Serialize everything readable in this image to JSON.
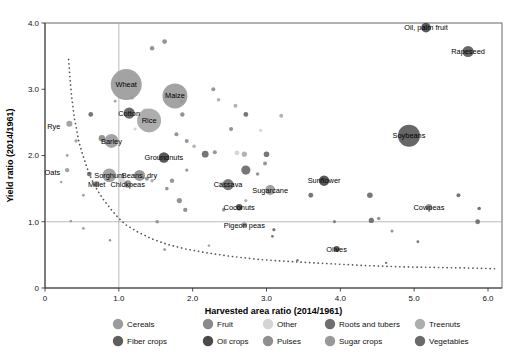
{
  "chart_data": {
    "type": "scatter",
    "title": "",
    "xlabel": "Harvested area ratio (2014/1961)",
    "ylabel": "Yield ratio (2014/1961)",
    "xlim": [
      0,
      6.2
    ],
    "ylim": [
      0,
      4.15
    ],
    "xticks": [
      "0",
      "1.0",
      "2.0",
      "3.0",
      "4.0",
      "5.0",
      "6.0"
    ],
    "xtick_values": [
      0,
      1,
      2,
      3,
      4,
      5,
      6
    ],
    "yticks": [
      "0",
      "1.0",
      "2.0",
      "3.0",
      "4.0"
    ],
    "ytick_values": [
      0,
      1,
      2,
      3,
      4
    ],
    "grid": false,
    "reference_lines": {
      "vertical_x": 1.0,
      "horizontal_y": 1.0
    },
    "annotation_curve": {
      "description": "dotted iso-production hyperbola curve x*y = 1",
      "points": [
        [
          0.32,
          3.45
        ],
        [
          0.34,
          3.15
        ],
        [
          0.36,
          2.9
        ],
        [
          0.38,
          2.72
        ],
        [
          0.4,
          2.55
        ],
        [
          0.43,
          2.38
        ],
        [
          0.46,
          2.2
        ],
        [
          0.5,
          2.05
        ],
        [
          0.55,
          1.88
        ],
        [
          0.6,
          1.72
        ],
        [
          0.66,
          1.57
        ],
        [
          0.73,
          1.44
        ],
        [
          0.8,
          1.32
        ],
        [
          0.9,
          1.18
        ],
        [
          1.0,
          1.05
        ],
        [
          1.1,
          0.95
        ],
        [
          1.25,
          0.85
        ],
        [
          1.45,
          0.74
        ],
        [
          1.65,
          0.66
        ],
        [
          1.9,
          0.59
        ],
        [
          2.2,
          0.53
        ],
        [
          2.5,
          0.48
        ],
        [
          2.9,
          0.43
        ],
        [
          3.3,
          0.4
        ],
        [
          3.8,
          0.37
        ],
        [
          4.3,
          0.34
        ],
        [
          4.8,
          0.32
        ],
        [
          5.3,
          0.31
        ],
        [
          5.8,
          0.3
        ],
        [
          6.1,
          0.29
        ]
      ]
    },
    "legend": {
      "position": "bottom",
      "rows": [
        [
          {
            "label": "Cereals",
            "color": "#9b9b9b"
          },
          {
            "label": "Fruit",
            "color": "#8a8a8a"
          },
          {
            "label": "Other",
            "color": "#d4d4d4"
          },
          {
            "label": "Roots and tubers",
            "color": "#6e6e6e"
          },
          {
            "label": "Treenuts",
            "color": "#adadad"
          }
        ],
        [
          {
            "label": "Fiber crops",
            "color": "#5e5e5e"
          },
          {
            "label": "Oil crops",
            "color": "#4a4a4a"
          },
          {
            "label": "Pulses",
            "color": "#8f8f8f"
          },
          {
            "label": "Sugar crops",
            "color": "#989898"
          },
          {
            "label": "Vegetables",
            "color": "#6a6a6a"
          }
        ]
      ]
    },
    "labeled_points": [
      {
        "name": "Wheat",
        "x": 1.1,
        "y": 3.07,
        "r": 15.5,
        "color": "#9b9b9b",
        "group": "Cereals",
        "label_dx": 0,
        "label_dy": 0,
        "label_anchor": "middle"
      },
      {
        "name": "Maize",
        "x": 1.76,
        "y": 2.9,
        "r": 12.5,
        "color": "#9b9b9b",
        "group": "Cereals",
        "label_dx": 0,
        "label_dy": 0,
        "label_anchor": "middle"
      },
      {
        "name": "Rice",
        "x": 1.41,
        "y": 2.53,
        "r": 12.0,
        "color": "#a6a6a6",
        "group": "Cereals",
        "label_dx": 0,
        "label_dy": 0,
        "label_anchor": "middle"
      },
      {
        "name": "Cotton",
        "x": 1.14,
        "y": 2.64,
        "r": 5.6,
        "color": "#5e5e5e",
        "group": "Fiber crops",
        "label_dx": 0,
        "label_dy": 0,
        "label_anchor": "middle"
      },
      {
        "name": "Barley",
        "x": 0.9,
        "y": 2.22,
        "r": 7.0,
        "color": "#9b9b9b",
        "group": "Cereals",
        "label_dx": 0,
        "label_dy": 0,
        "label_anchor": "middle"
      },
      {
        "name": "Rye",
        "x": 0.33,
        "y": 2.48,
        "r": 3.0,
        "color": "#9b9b9b",
        "group": "Cereals",
        "label_dx": -9,
        "label_dy": 2.5,
        "label_anchor": "end"
      },
      {
        "name": "Oats",
        "x": 0.3,
        "y": 1.78,
        "r": 2.2,
        "color": "#9b9b9b",
        "group": "Cereals",
        "label_dx": -7,
        "label_dy": 2.5,
        "label_anchor": "end"
      },
      {
        "name": "Groundnuts",
        "x": 1.61,
        "y": 1.97,
        "r": 5.2,
        "color": "#4a4a4a",
        "group": "Oil crops",
        "label_dx": 0,
        "label_dy": 0,
        "label_anchor": "middle"
      },
      {
        "name": "Sorghum",
        "x": 0.87,
        "y": 1.7,
        "r": 6.8,
        "color": "#9b9b9b",
        "group": "Cereals",
        "label_dx": 0,
        "label_dy": 0,
        "label_anchor": "middle"
      },
      {
        "name": "Beans, dry",
        "x": 1.28,
        "y": 1.7,
        "r": 5.5,
        "color": "#8f8f8f",
        "group": "Pulses",
        "label_dx": 0,
        "label_dy": 0,
        "label_anchor": "middle"
      },
      {
        "name": "Millet",
        "x": 0.7,
        "y": 1.57,
        "r": 3.0,
        "color": "#9b9b9b",
        "group": "Cereals",
        "label_dx": 0,
        "label_dy": 0,
        "label_anchor": "middle"
      },
      {
        "name": "Chickpeas",
        "x": 1.12,
        "y": 1.57,
        "r": 3.8,
        "color": "#8f8f8f",
        "group": "Pulses",
        "label_dx": 0,
        "label_dy": 0,
        "label_anchor": "middle"
      },
      {
        "name": "Cassava",
        "x": 2.48,
        "y": 1.56,
        "r": 5.6,
        "color": "#6e6e6e",
        "group": "Roots and tubers",
        "label_dx": 0,
        "label_dy": 0,
        "label_anchor": "middle"
      },
      {
        "name": "Sugarcane",
        "x": 3.05,
        "y": 1.48,
        "r": 5.0,
        "color": "#989898",
        "group": "Sugar crops",
        "label_dx": 0,
        "label_dy": 0,
        "label_anchor": "middle"
      },
      {
        "name": "Sunflower",
        "x": 3.78,
        "y": 1.62,
        "r": 5.2,
        "color": "#4a4a4a",
        "group": "Oil crops",
        "label_dx": 0,
        "label_dy": 0,
        "label_anchor": "middle"
      },
      {
        "name": "Coconuts",
        "x": 2.63,
        "y": 1.22,
        "r": 3.2,
        "color": "#4a4a4a",
        "group": "Oil crops",
        "label_dx": 0,
        "label_dy": 0,
        "label_anchor": "middle"
      },
      {
        "name": "Pigeon peas",
        "x": 2.7,
        "y": 0.95,
        "r": 2.8,
        "color": "#8f8f8f",
        "group": "Pulses",
        "label_dx": 0,
        "label_dy": 0,
        "label_anchor": "middle"
      },
      {
        "name": "Cowpeas",
        "x": 5.2,
        "y": 1.22,
        "r": 3.2,
        "color": "#8f8f8f",
        "group": "Pulses",
        "label_dx": 0,
        "label_dy": 0,
        "label_anchor": "middle"
      },
      {
        "name": "Olives",
        "x": 3.95,
        "y": 0.59,
        "r": 3.0,
        "color": "#4a4a4a",
        "group": "Oil crops",
        "label_dx": 0,
        "label_dy": 0,
        "label_anchor": "middle"
      },
      {
        "name": "Soybeans",
        "x": 4.93,
        "y": 2.3,
        "r": 11.0,
        "color": "#5a5a5a",
        "group": "Oil crops",
        "label_dx": 0,
        "label_dy": 0,
        "label_anchor": "middle"
      },
      {
        "name": "Rapeseed",
        "x": 5.73,
        "y": 3.57,
        "r": 5.6,
        "color": "#5a5a5a",
        "group": "Oil crops",
        "label_dx": 0,
        "label_dy": 0,
        "label_anchor": "middle"
      },
      {
        "name": "Oil, palm fruit",
        "x": 5.16,
        "y": 3.93,
        "r": 4.8,
        "color": "#4a4a4a",
        "group": "Oil crops",
        "label_dx": 0,
        "label_dy": 0,
        "label_anchor": "middle"
      }
    ],
    "unlabeled_points": [
      {
        "x": 1.62,
        "y": 3.72,
        "r": 2.4,
        "color": "#8a8a8a"
      },
      {
        "x": 1.45,
        "y": 3.62,
        "r": 2.2,
        "color": "#8a8a8a"
      },
      {
        "x": 2.28,
        "y": 3.0,
        "r": 2.0,
        "color": "#8f8f8f"
      },
      {
        "x": 2.35,
        "y": 2.84,
        "r": 1.8,
        "color": "#adadad"
      },
      {
        "x": 1.85,
        "y": 2.82,
        "r": 2.2,
        "color": "#8a8a8a"
      },
      {
        "x": 0.62,
        "y": 2.62,
        "r": 2.4,
        "color": "#6a6a6a"
      },
      {
        "x": 1.18,
        "y": 2.87,
        "r": 1.6,
        "color": "#8a8a8a"
      },
      {
        "x": 1.35,
        "y": 2.68,
        "r": 2.2,
        "color": "#d4d4d4"
      },
      {
        "x": 1.86,
        "y": 2.62,
        "r": 2.2,
        "color": "#8a8a8a"
      },
      {
        "x": 2.72,
        "y": 2.62,
        "r": 2.4,
        "color": "#6a6a6a"
      },
      {
        "x": 2.58,
        "y": 2.75,
        "r": 2.0,
        "color": "#adadad"
      },
      {
        "x": 3.2,
        "y": 2.6,
        "r": 2.0,
        "color": "#adadad"
      },
      {
        "x": 2.52,
        "y": 2.4,
        "r": 2.0,
        "color": "#8a8a8a"
      },
      {
        "x": 2.92,
        "y": 2.38,
        "r": 1.6,
        "color": "#d4d4d4"
      },
      {
        "x": 1.78,
        "y": 2.32,
        "r": 2.0,
        "color": "#8a8a8a"
      },
      {
        "x": 1.92,
        "y": 2.22,
        "r": 2.0,
        "color": "#8f8f8f"
      },
      {
        "x": 2.02,
        "y": 2.14,
        "r": 1.8,
        "color": "#adadad"
      },
      {
        "x": 0.77,
        "y": 2.26,
        "r": 3.2,
        "color": "#8a8a8a"
      },
      {
        "x": 2.17,
        "y": 2.02,
        "r": 3.4,
        "color": "#6a6a6a"
      },
      {
        "x": 2.3,
        "y": 2.05,
        "r": 2.0,
        "color": "#8f8f8f"
      },
      {
        "x": 2.6,
        "y": 2.04,
        "r": 2.4,
        "color": "#d4d4d4"
      },
      {
        "x": 2.7,
        "y": 2.02,
        "r": 2.6,
        "color": "#adadad"
      },
      {
        "x": 3.0,
        "y": 2.02,
        "r": 2.8,
        "color": "#6a6a6a"
      },
      {
        "x": 2.98,
        "y": 1.88,
        "r": 2.0,
        "color": "#8f8f8f"
      },
      {
        "x": 2.72,
        "y": 1.78,
        "r": 4.6,
        "color": "#6a6a6a"
      },
      {
        "x": 2.88,
        "y": 1.72,
        "r": 1.8,
        "color": "#8f8f8f"
      },
      {
        "x": 0.6,
        "y": 1.72,
        "r": 2.4,
        "color": "#6a6a6a"
      },
      {
        "x": 1.38,
        "y": 1.65,
        "r": 2.0,
        "color": "#8f8f8f"
      },
      {
        "x": 1.45,
        "y": 1.62,
        "r": 1.8,
        "color": "#adadad"
      },
      {
        "x": 1.04,
        "y": 1.63,
        "r": 3.0,
        "color": "#d4d4d4"
      },
      {
        "x": 1.72,
        "y": 1.62,
        "r": 2.2,
        "color": "#8f8f8f"
      },
      {
        "x": 1.65,
        "y": 1.5,
        "r": 1.8,
        "color": "#8f8f8f"
      },
      {
        "x": 2.4,
        "y": 1.56,
        "r": 3.2,
        "color": "#d4d4d4"
      },
      {
        "x": 3.6,
        "y": 1.4,
        "r": 2.4,
        "color": "#6a6a6a"
      },
      {
        "x": 4.4,
        "y": 1.4,
        "r": 2.8,
        "color": "#6a6a6a"
      },
      {
        "x": 5.6,
        "y": 1.4,
        "r": 2.0,
        "color": "#6a6a6a"
      },
      {
        "x": 1.82,
        "y": 1.32,
        "r": 2.6,
        "color": "#8a8a8a"
      },
      {
        "x": 1.9,
        "y": 1.18,
        "r": 2.2,
        "color": "#8a8a8a"
      },
      {
        "x": 2.42,
        "y": 1.18,
        "r": 1.8,
        "color": "#8f8f8f"
      },
      {
        "x": 2.72,
        "y": 1.32,
        "r": 1.6,
        "color": "#adadad"
      },
      {
        "x": 5.88,
        "y": 1.2,
        "r": 1.8,
        "color": "#6a6a6a"
      },
      {
        "x": 4.42,
        "y": 1.02,
        "r": 2.6,
        "color": "#6a6a6a"
      },
      {
        "x": 4.52,
        "y": 1.05,
        "r": 1.8,
        "color": "#8f8f8f"
      },
      {
        "x": 5.86,
        "y": 1.0,
        "r": 2.4,
        "color": "#6a6a6a"
      },
      {
        "x": 1.52,
        "y": 1.0,
        "r": 1.8,
        "color": "#8f8f8f"
      },
      {
        "x": 0.35,
        "y": 1.01,
        "r": 1.4,
        "color": "#9b9b9b"
      },
      {
        "x": 3.1,
        "y": 0.88,
        "r": 1.6,
        "color": "#6a6a6a"
      },
      {
        "x": 4.7,
        "y": 0.86,
        "r": 1.6,
        "color": "#8f8f8f"
      },
      {
        "x": 3.08,
        "y": 0.78,
        "r": 1.4,
        "color": "#6a6a6a"
      },
      {
        "x": 5.05,
        "y": 0.7,
        "r": 1.4,
        "color": "#6a6a6a"
      },
      {
        "x": 1.62,
        "y": 0.58,
        "r": 1.4,
        "color": "#8f8f8f"
      },
      {
        "x": 0.52,
        "y": 1.4,
        "r": 1.4,
        "color": "#9b9b9b"
      },
      {
        "x": 0.3,
        "y": 2.0,
        "r": 1.4,
        "color": "#9b9b9b"
      },
      {
        "x": 0.42,
        "y": 2.22,
        "r": 1.6,
        "color": "#9b9b9b"
      },
      {
        "x": 0.22,
        "y": 1.6,
        "r": 1.2,
        "color": "#9b9b9b"
      },
      {
        "x": 0.52,
        "y": 0.9,
        "r": 1.4,
        "color": "#9b9b9b"
      },
      {
        "x": 0.88,
        "y": 0.72,
        "r": 1.2,
        "color": "#8f8f8f"
      },
      {
        "x": 2.22,
        "y": 0.64,
        "r": 1.2,
        "color": "#8f8f8f"
      },
      {
        "x": 3.42,
        "y": 0.42,
        "r": 1.2,
        "color": "#6a6a6a"
      },
      {
        "x": 4.62,
        "y": 0.38,
        "r": 1.2,
        "color": "#6a6a6a"
      },
      {
        "x": 3.92,
        "y": 1.0,
        "r": 1.4,
        "color": "#6a6a6a"
      },
      {
        "x": 1.92,
        "y": 1.78,
        "r": 1.6,
        "color": "#8f8f8f"
      },
      {
        "x": 0.95,
        "y": 2.82,
        "r": 1.4,
        "color": "#9b9b9b"
      },
      {
        "x": 1.22,
        "y": 2.4,
        "r": 1.6,
        "color": "#d4d4d4"
      }
    ]
  }
}
